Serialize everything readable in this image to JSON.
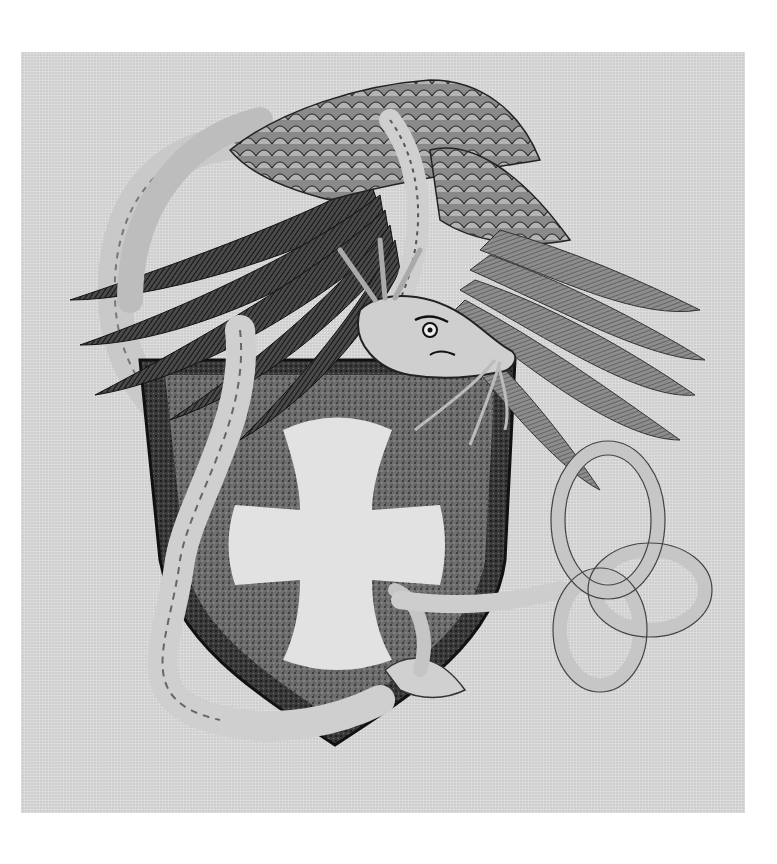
{
  "artwork": {
    "medium": "pen-and-ink stipple drawing",
    "subject": "winged serpent-dragon coiled around a heraldic shield with a white cross pattée; tail tied in a knot at right",
    "palette": {
      "page": "#ffffff",
      "paper": "#dcdcdc",
      "ink_dark": "#1e1e1e",
      "ink_mid": "#5a5a5a",
      "shield_field": "#6e6e6e",
      "cross": "#e2e2e2",
      "body_light": "#c9c9c9"
    },
    "elements": [
      {
        "name": "left-wing",
        "description": "dark hatched flight feathers sweeping to upper left"
      },
      {
        "name": "right-wing",
        "description": "lighter scaled coverts and long feathers sweeping to right"
      },
      {
        "name": "dragon-head",
        "description": "scowling head with whiskers facing right"
      },
      {
        "name": "shield",
        "description": "heater shield, dark stippled border and field"
      },
      {
        "name": "cross",
        "description": "white cross pattée on shield"
      },
      {
        "name": "serpent-body",
        "description": "scaled body coiling from the left down around the shield"
      },
      {
        "name": "knot-tail",
        "description": "tail tied into a looping knot at the right"
      }
    ]
  }
}
